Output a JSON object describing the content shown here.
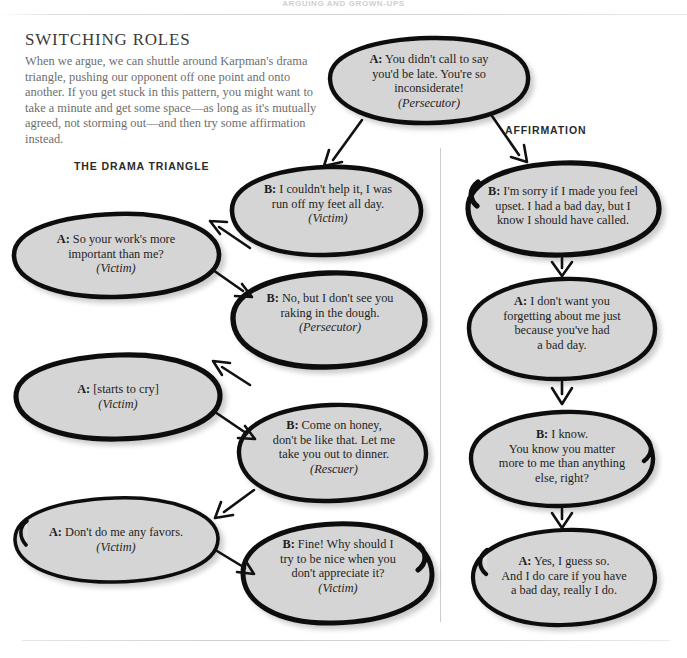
{
  "running_head": "ARGUING AND GROWN-UPS",
  "intro": {
    "title": "SWITCHING ROLES",
    "body": "When we argue, we can shuttle around Karpman's drama triangle, pushing our opponent off one point and onto another. If you get stuck in this pattern, you might want to take a minute and get some space—as long as it's mutually agreed, not storming out—and then try some affirmation instead."
  },
  "headings": {
    "drama_triangle": "THE DRAMA TRIANGLE",
    "affirmation": "AFFIRMATION"
  },
  "colors": {
    "bubble_fill": "#d5d5d5",
    "bubble_stroke": "#111111",
    "page_background": "#ffffff",
    "divider": "#cdcdcd",
    "intro_text": "#6e6e6e"
  },
  "bubbles": {
    "start": {
      "speaker": "A:",
      "lines": [
        "You didn't call to say",
        "you'd be late. You're so",
        "inconsiderate!"
      ],
      "role": "(Persecutor)"
    },
    "left_column": [
      {
        "speaker": "A:",
        "lines": [
          "So your work's more",
          "important than me?"
        ],
        "role": "(Victim)"
      },
      {
        "speaker": "A:",
        "lines": [
          "[starts to cry]"
        ],
        "role": "(Victim)"
      },
      {
        "speaker": "A:",
        "lines": [
          "Don't do me any favors."
        ],
        "role": "(Victim)"
      }
    ],
    "middle_column": [
      {
        "speaker": "B:",
        "lines": [
          "I couldn't help it, I was",
          "run off my feet all day."
        ],
        "role": "(Victim)"
      },
      {
        "speaker": "B:",
        "lines": [
          "No, but I don't see you",
          "raking in the dough."
        ],
        "role": "(Persecutor)"
      },
      {
        "speaker": "B:",
        "lines": [
          "Come on honey,",
          "don't be like that. Let me",
          "take you out to dinner."
        ],
        "role": "(Rescuer)"
      },
      {
        "speaker": "B:",
        "lines": [
          "Fine! Why should I",
          "try to be nice when you",
          "don't appreciate it?"
        ],
        "role": "(Victim)"
      }
    ],
    "right_column": [
      {
        "speaker": "B:",
        "lines": [
          "I'm sorry if I made you feel",
          "upset. I had a bad day, but I",
          "know I should have called."
        ],
        "role": ""
      },
      {
        "speaker": "A:",
        "lines": [
          "I don't want you",
          "forgetting about me just",
          "because you've had",
          "a bad day."
        ],
        "role": ""
      },
      {
        "speaker": "B:",
        "lines": [
          "I know.",
          "You know you matter",
          "more to me than anything",
          "else, right?"
        ],
        "role": ""
      },
      {
        "speaker": "A:",
        "lines": [
          "Yes, I guess so.",
          "And I do care if you have",
          "a bad day, really I do."
        ],
        "role": ""
      }
    ]
  }
}
